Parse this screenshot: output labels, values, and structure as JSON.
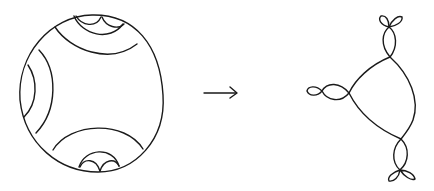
{
  "figure": {
    "left_panel": {
      "shape": "disk",
      "arc_groups": [
        "top",
        "left",
        "bottom"
      ]
    },
    "arrow": {
      "direction": "right"
    },
    "right_panel": {
      "shape": "graph",
      "vertices": 3,
      "loop_clusters": [
        "top",
        "left",
        "bottom"
      ]
    },
    "colors": {
      "stroke": "#1a1a1a",
      "background": "#ffffff"
    }
  }
}
